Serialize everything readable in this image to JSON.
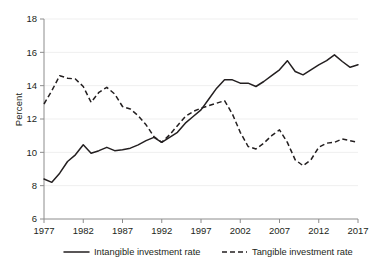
{
  "chart_data": {
    "type": "line",
    "title": "",
    "subtitle": "",
    "xlabel": "",
    "ylabel": "Percent",
    "xlim": [
      1977,
      2017
    ],
    "ylim": [
      6,
      18
    ],
    "yticks": [
      6,
      8,
      10,
      12,
      14,
      16,
      18
    ],
    "ytick_labels": [
      "6",
      "8",
      "10",
      "12",
      "14",
      "16",
      "18"
    ],
    "xticks": [
      1977,
      1982,
      1987,
      1992,
      1997,
      2002,
      2007,
      2012,
      2017
    ],
    "xtick_labels": [
      "1977",
      "1982",
      "1987",
      "1992",
      "1997",
      "2002",
      "2007",
      "2012",
      "2017"
    ],
    "grid": "horizontal",
    "legend_position": "bottom",
    "x": [
      1977,
      1978,
      1979,
      1980,
      1981,
      1982,
      1983,
      1984,
      1985,
      1986,
      1987,
      1988,
      1989,
      1990,
      1991,
      1992,
      1993,
      1994,
      1995,
      1996,
      1997,
      1998,
      1999,
      2000,
      2001,
      2002,
      2003,
      2004,
      2005,
      2006,
      2007,
      2008,
      2009,
      2010,
      2011,
      2012,
      2013,
      2014,
      2015,
      2016,
      2017
    ],
    "series": [
      {
        "name": "Intangible investment rate",
        "style": "solid",
        "color": "#231f20",
        "values": [
          8.4,
          8.2,
          8.75,
          9.45,
          9.85,
          10.45,
          9.95,
          10.1,
          10.3,
          10.1,
          10.15,
          10.25,
          10.45,
          10.7,
          10.9,
          10.6,
          10.9,
          11.2,
          11.75,
          12.15,
          12.55,
          13.2,
          13.85,
          14.35,
          14.35,
          14.15,
          14.15,
          13.95,
          14.25,
          14.6,
          14.95,
          15.5,
          14.85,
          14.65,
          14.95,
          15.25,
          15.5,
          15.85,
          15.45,
          15.1,
          15.25
        ]
      },
      {
        "name": "Tangible investment rate",
        "style": "dashed",
        "color": "#231f20",
        "values": [
          12.9,
          13.7,
          14.6,
          14.45,
          14.4,
          13.95,
          13.0,
          13.6,
          13.9,
          13.5,
          12.75,
          12.6,
          12.2,
          11.65,
          10.95,
          10.6,
          11.05,
          11.6,
          12.15,
          12.45,
          12.65,
          12.8,
          12.95,
          13.1,
          12.3,
          11.2,
          10.35,
          10.2,
          10.55,
          11.0,
          11.35,
          10.6,
          9.55,
          9.2,
          9.55,
          10.3,
          10.55,
          10.6,
          10.8,
          10.7,
          10.6
        ]
      }
    ],
    "legend": [
      {
        "label": "Intangible investment rate",
        "style": "solid"
      },
      {
        "label": "Tangible investment rate",
        "style": "dashed"
      }
    ]
  }
}
